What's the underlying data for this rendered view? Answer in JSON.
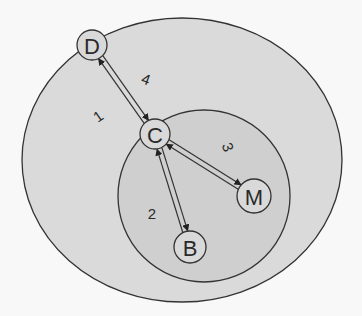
{
  "diagram": {
    "colors": {
      "background": "#f8f8f8",
      "outer_region": "#dadada",
      "inner_region": "#cfcfcf",
      "node_fill": "#d9d9d9",
      "stroke": "#333333"
    },
    "regions": [
      {
        "id": "outer",
        "shape": "ellipse",
        "cx": 182,
        "cy": 160,
        "rx": 160,
        "ry": 142
      },
      {
        "id": "inner",
        "shape": "circle",
        "cx": 204,
        "cy": 196,
        "r": 86
      }
    ],
    "nodes": [
      {
        "id": "D",
        "label": "D",
        "cx": 92,
        "cy": 45,
        "r": 15
      },
      {
        "id": "C",
        "label": "C",
        "cx": 155,
        "cy": 134,
        "r": 15
      },
      {
        "id": "M",
        "label": "M",
        "cx": 254,
        "cy": 196,
        "r": 17
      },
      {
        "id": "B",
        "label": "B",
        "cx": 190,
        "cy": 247,
        "r": 16
      }
    ],
    "edges": [
      {
        "from": "C",
        "to": "D",
        "labels": [
          "1",
          "4"
        ],
        "bidirectional": true
      },
      {
        "from": "C",
        "to": "B",
        "labels": [
          "2"
        ],
        "bidirectional": true
      },
      {
        "from": "C",
        "to": "M",
        "labels": [
          "3"
        ],
        "bidirectional": true
      }
    ],
    "edge_labels": [
      {
        "text": "1",
        "x": 98,
        "y": 116,
        "rotate": -35
      },
      {
        "text": "4",
        "x": 146,
        "y": 79,
        "rotate": 20
      },
      {
        "text": "2",
        "x": 152,
        "y": 213,
        "rotate": 0
      },
      {
        "text": "3",
        "x": 228,
        "y": 147,
        "rotate": 70
      }
    ]
  }
}
